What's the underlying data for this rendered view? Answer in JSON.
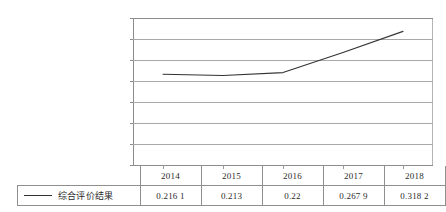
{
  "chart_data": {
    "type": "line",
    "title": "",
    "subtitle": "",
    "xlabel": "",
    "ylabel": "",
    "categories": [
      "2014",
      "2015",
      "2016",
      "2017",
      "2018"
    ],
    "series": [
      {
        "name": "综合评价结果",
        "values": [
          0.2161,
          0.213,
          0.22,
          0.2679,
          0.3182
        ],
        "value_labels": [
          "0.216 1",
          "0.213",
          "0.22",
          "0.267 9",
          "0.318 2"
        ],
        "color": "#333333"
      }
    ],
    "ylim": [
      0,
      0.35
    ],
    "yticks": [
      0,
      0.05,
      0.1,
      0.15,
      0.2,
      0.25,
      0.3,
      0.35
    ],
    "ytick_labels": [
      "0",
      "0.05",
      "0.1",
      "0.15",
      "0.2",
      "0.25",
      "0.3",
      "0.35"
    ],
    "grid": true,
    "grid_axis": "y",
    "legend_position": "bottom-left-table",
    "has_data_table": true
  },
  "axis": {
    "y": {
      "labels": [
        "0.35",
        "0.3",
        "0.25",
        "0.2",
        "0.15",
        "0.1",
        "0.05",
        "0"
      ]
    }
  },
  "table": {
    "legend_label": "综合评价结果",
    "year_row": [
      "2014",
      "2015",
      "2016",
      "2017",
      "2018"
    ],
    "value_row": [
      "0.216 1",
      "0.213",
      "0.22",
      "0.267 9",
      "0.318 2"
    ]
  },
  "colors": {
    "series_line": "#333333",
    "gridline": "#a8a8a8",
    "axis": "#8c8c8c",
    "table_border": "#8f8f8f",
    "text": "#2b2b2b",
    "background": "#ffffff"
  }
}
